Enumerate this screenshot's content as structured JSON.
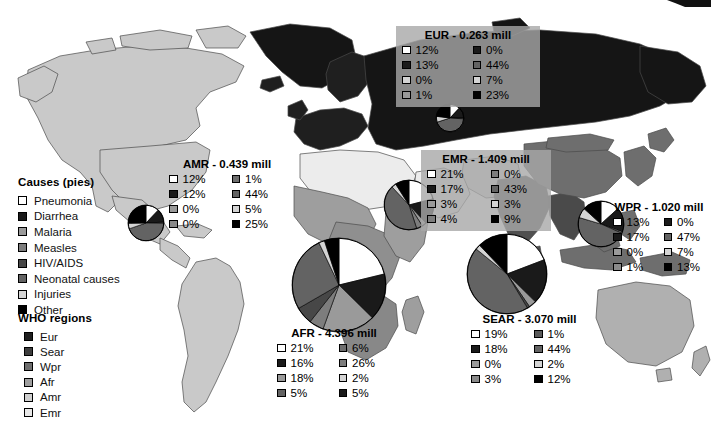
{
  "figure": {
    "kind": "world-map-with-pies",
    "bg_color": "#ffffff"
  },
  "legend_causes": {
    "title": "Causes (pies)",
    "items": [
      {
        "label": "Pneumonia",
        "color": "#ffffff",
        "key": "pneumonia"
      },
      {
        "label": "Diarrhea",
        "color": "#1a1a1a",
        "key": "diarrhea"
      },
      {
        "label": "Malaria",
        "color": "#9a9a9a",
        "key": "malaria"
      },
      {
        "label": "Measles",
        "color": "#7d7d7d",
        "key": "measles"
      },
      {
        "label": "HIV/AIDS",
        "color": "#474747",
        "key": "hivaids"
      },
      {
        "label": "Neonatal causes",
        "color": "#636363",
        "key": "neonatal"
      },
      {
        "label": "Injuries",
        "color": "#d4d4d4",
        "key": "injuries"
      },
      {
        "label": "Other",
        "color": "#000000",
        "key": "other"
      }
    ]
  },
  "legend_regions": {
    "title": "WHO regions",
    "items": [
      {
        "label": "Eur",
        "color": "#1f1f1f"
      },
      {
        "label": "Sear",
        "color": "#3d3d3d"
      },
      {
        "label": "Wpr",
        "color": "#6e6e6e"
      },
      {
        "label": "Afr",
        "color": "#9e9e9e"
      },
      {
        "label": "Amr",
        "color": "#cfcfcf"
      },
      {
        "label": "Emr",
        "color": "#e8e8e8"
      }
    ]
  },
  "regions": {
    "eur": {
      "title": "EUR - 0.263 mill",
      "total_mill": 0.263,
      "shaded": true,
      "percents": [
        12,
        13,
        0,
        1,
        0,
        44,
        7,
        23
      ],
      "cells": [
        {
          "color": "#ffffff",
          "value": "12%"
        },
        {
          "color": "#1a1a1a",
          "value": "0%"
        },
        {
          "color": "#1a1a1a",
          "value": "13%"
        },
        {
          "color": "#636363",
          "value": "44%"
        },
        {
          "color": "#d4d4d4",
          "value": "0%"
        },
        {
          "color": "#d4d4d4",
          "value": "7%"
        },
        {
          "color": "#9a9a9a",
          "value": "1%"
        },
        {
          "color": "#000000",
          "value": "23%"
        }
      ]
    },
    "amr": {
      "title": "AMR - 0.439 mill",
      "total_mill": 0.439,
      "shaded": false,
      "percents": [
        12,
        12,
        0,
        0,
        1,
        44,
        5,
        25
      ],
      "cells": [
        {
          "color": "#ffffff",
          "value": "12%"
        },
        {
          "color": "#6e6e6e",
          "value": "1%"
        },
        {
          "color": "#1a1a1a",
          "value": "12%"
        },
        {
          "color": "#636363",
          "value": "44%"
        },
        {
          "color": "#9a9a9a",
          "value": "0%"
        },
        {
          "color": "#d4d4d4",
          "value": "5%"
        },
        {
          "color": "#8a8a8a",
          "value": "0%"
        },
        {
          "color": "#000000",
          "value": "25%"
        }
      ]
    },
    "emr": {
      "title": "EMR - 1.409 mill",
      "total_mill": 1.409,
      "shaded": true,
      "percents": [
        21,
        17,
        3,
        4,
        0,
        43,
        3,
        9
      ],
      "cells": [
        {
          "color": "#ffffff",
          "value": "21%"
        },
        {
          "color": "#7d7d7d",
          "value": "0%"
        },
        {
          "color": "#1a1a1a",
          "value": "17%"
        },
        {
          "color": "#636363",
          "value": "43%"
        },
        {
          "color": "#9a9a9a",
          "value": "3%"
        },
        {
          "color": "#d4d4d4",
          "value": "3%"
        },
        {
          "color": "#7d7d7d",
          "value": "4%"
        },
        {
          "color": "#000000",
          "value": "9%"
        }
      ]
    },
    "wpr": {
      "title": "WPR - 1.020 mill",
      "total_mill": 1.02,
      "shaded": false,
      "percents": [
        13,
        17,
        0,
        1,
        0,
        47,
        7,
        13
      ],
      "cells": [
        {
          "color": "#ffffff",
          "value": "13%"
        },
        {
          "color": "#1a1a1a",
          "value": "0%"
        },
        {
          "color": "#1a1a1a",
          "value": "17%"
        },
        {
          "color": "#636363",
          "value": "47%"
        },
        {
          "color": "#9a9a9a",
          "value": "0%"
        },
        {
          "color": "#d4d4d4",
          "value": "7%"
        },
        {
          "color": "#8a8a8a",
          "value": "1%"
        },
        {
          "color": "#000000",
          "value": "13%"
        }
      ]
    },
    "afr": {
      "title": "AFR - 4.396 mill",
      "total_mill": 4.396,
      "shaded": false,
      "percents": [
        21,
        16,
        18,
        5,
        6,
        26,
        2,
        5
      ],
      "cells": [
        {
          "color": "#ffffff",
          "value": "21%"
        },
        {
          "color": "#6e6e6e",
          "value": "6%"
        },
        {
          "color": "#1a1a1a",
          "value": "16%"
        },
        {
          "color": "#7d7d7d",
          "value": "26%"
        },
        {
          "color": "#9a9a9a",
          "value": "18%"
        },
        {
          "color": "#d4d4d4",
          "value": "2%"
        },
        {
          "color": "#636363",
          "value": "5%"
        },
        {
          "color": "#1a1a1a",
          "value": "5%"
        }
      ]
    },
    "sear": {
      "title": "SEAR - 3.070 mill",
      "total_mill": 3.07,
      "shaded": false,
      "percents": [
        19,
        18,
        0,
        3,
        1,
        44,
        2,
        12
      ],
      "cells": [
        {
          "color": "#ffffff",
          "value": "19%"
        },
        {
          "color": "#5a5a5a",
          "value": "1%"
        },
        {
          "color": "#1a1a1a",
          "value": "18%"
        },
        {
          "color": "#636363",
          "value": "44%"
        },
        {
          "color": "#9a9a9a",
          "value": "0%"
        },
        {
          "color": "#d4d4d4",
          "value": "2%"
        },
        {
          "color": "#8a8a8a",
          "value": "3%"
        },
        {
          "color": "#000000",
          "value": "12%"
        }
      ]
    }
  },
  "chart_data": {
    "type": "pie",
    "slice_labels": [
      "Pneumonia",
      "Diarrhea",
      "Malaria",
      "Measles",
      "HIV/AIDS",
      "Neonatal causes",
      "Injuries",
      "Other"
    ],
    "slice_colors": [
      "#ffffff",
      "#1a1a1a",
      "#9a9a9a",
      "#7d7d7d",
      "#474747",
      "#636363",
      "#d4d4d4",
      "#000000"
    ],
    "charts": [
      {
        "name": "EUR",
        "total_mill": 0.263,
        "values": [
          12,
          13,
          1,
          0,
          0,
          44,
          7,
          23
        ]
      },
      {
        "name": "AMR",
        "total_mill": 0.439,
        "values": [
          12,
          12,
          0,
          0,
          1,
          44,
          5,
          25
        ]
      },
      {
        "name": "EMR",
        "total_mill": 1.409,
        "values": [
          21,
          17,
          3,
          4,
          0,
          43,
          3,
          9
        ]
      },
      {
        "name": "WPR",
        "total_mill": 1.02,
        "values": [
          13,
          17,
          1,
          0,
          0,
          47,
          7,
          13
        ]
      },
      {
        "name": "AFR",
        "total_mill": 4.396,
        "values": [
          21,
          16,
          18,
          5,
          6,
          26,
          2,
          5
        ]
      },
      {
        "name": "SEAR",
        "total_mill": 3.07,
        "values": [
          19,
          18,
          3,
          0,
          1,
          44,
          2,
          12
        ]
      }
    ],
    "ylabel": "",
    "xlabel": "",
    "legend_position": "left"
  }
}
